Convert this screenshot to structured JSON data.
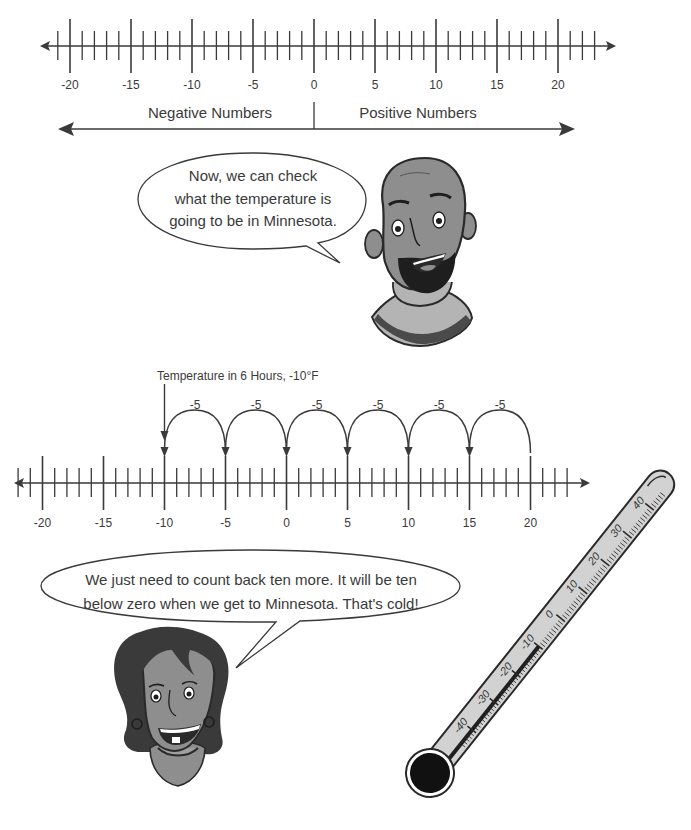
{
  "top_number_line": {
    "min_tick": -21,
    "max_tick": 23,
    "labels": [
      "-20",
      "-15",
      "-10",
      "-5",
      "0",
      "5",
      "10",
      "15",
      "20"
    ],
    "label_values": [
      -20,
      -15,
      -10,
      -5,
      0,
      5,
      10,
      15,
      20
    ]
  },
  "sign_arrows": {
    "negative_label": "Negative Numbers",
    "positive_label": "Positive Numbers"
  },
  "man_bubble": {
    "lines": [
      "Now, we can check",
      "what the temperature is",
      "going to be in Minnesota."
    ]
  },
  "hop_diagram": {
    "annotation": "Temperature in 6 Hours, -10°F",
    "start": 20,
    "end": -10,
    "step": -5,
    "hop_label": "-5",
    "hops": [
      {
        "from": 20,
        "to": 15,
        "label": "-5"
      },
      {
        "from": 15,
        "to": 10,
        "label": "-5"
      },
      {
        "from": 10,
        "to": 5,
        "label": "-5"
      },
      {
        "from": 5,
        "to": 0,
        "label": "-5"
      },
      {
        "from": 0,
        "to": -5,
        "label": "-5"
      },
      {
        "from": -5,
        "to": -10,
        "label": "-5"
      }
    ]
  },
  "bottom_number_line": {
    "min_tick": -22,
    "max_tick": 23,
    "labels": [
      "-20",
      "-15",
      "-10",
      "-5",
      "0",
      "5",
      "10",
      "15",
      "20"
    ],
    "label_values": [
      -20,
      -15,
      -10,
      -5,
      0,
      5,
      10,
      15,
      20
    ]
  },
  "woman_bubble": {
    "lines": [
      "We just need to count back ten more. It will be ten",
      "below zero when we get to Minnesota. That's cold!"
    ]
  },
  "thermometer": {
    "scale_labels": [
      "-40",
      "-30",
      "-20",
      "-10",
      "0",
      "10",
      "20",
      "30",
      "40"
    ],
    "reading": -10
  },
  "colors": {
    "ink": "#3a3a3a",
    "skin": "#8e8e8e",
    "sweater": "#b4b4b4",
    "glass": "#cfcfcf"
  }
}
